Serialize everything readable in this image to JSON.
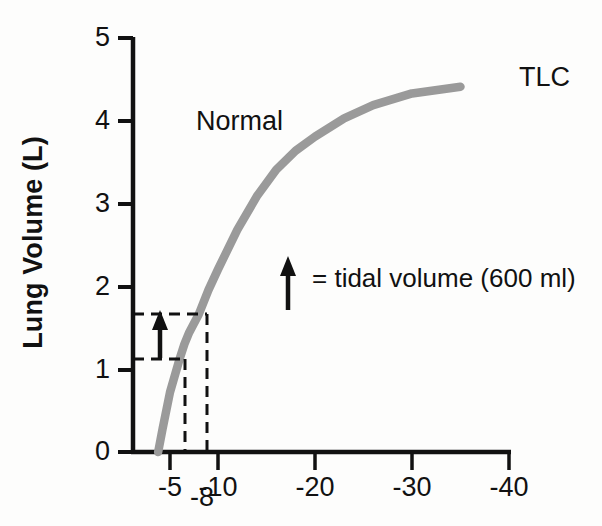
{
  "figure": {
    "background_color": "#fdfdfc",
    "curve_color": "#9a9a9a",
    "axis_color": "#111111"
  },
  "axes": {
    "y_title": "Lung Volume (L)",
    "y_ticks": [
      "5",
      "4",
      "3",
      "2",
      "1",
      "0"
    ],
    "x_ticks": [
      "-5",
      "-10",
      "-20",
      "-30",
      "-40"
    ],
    "x_extra_tick": "-8"
  },
  "annotations": {
    "curve_name": "Normal",
    "curve_end_label": "TLC",
    "legend_label": "= tidal volume (600 ml)",
    "legend_icon": "up-arrow-icon",
    "tidal_arrow_icon": "up-arrow-icon"
  },
  "chart_data": {
    "type": "line",
    "title": "",
    "subtitle": "",
    "xlabel": "",
    "ylabel": "Lung Volume (L)",
    "xlim": [
      0,
      -40
    ],
    "ylim": [
      0,
      5
    ],
    "x_tick_values": [
      -5,
      -10,
      -20,
      -30,
      -40
    ],
    "x_extra_tick_values": [
      -8
    ],
    "y_tick_values": [
      0,
      1,
      2,
      3,
      4,
      5
    ],
    "x_axis_scale": "nonlinear-compressed",
    "grid": false,
    "legend_position": "inside-center",
    "series": [
      {
        "name": "Normal",
        "color": "#9a9a9a",
        "style": "solid",
        "end_label": "TLC",
        "x": [
          -3.4,
          -4.0,
          -5.0,
          -6.0,
          -6.5,
          -7.0,
          -8.0,
          -9.0,
          -10.0,
          -12.0,
          -14.0,
          -16.0,
          -18.0,
          -20.0,
          -23.0,
          -26.0,
          -30.0,
          -35.0
        ],
        "y": [
          0.0,
          0.28,
          0.72,
          1.12,
          1.3,
          1.44,
          1.66,
          1.95,
          2.2,
          2.68,
          3.08,
          3.4,
          3.63,
          3.8,
          4.02,
          4.18,
          4.32,
          4.4
        ]
      }
    ],
    "annotations": [
      {
        "type": "guide-line",
        "style": "dashed",
        "orientation": "horizontal",
        "value": 1.66,
        "label": "end-inspiration volume"
      },
      {
        "type": "guide-line",
        "style": "dashed",
        "orientation": "horizontal",
        "value": 1.12,
        "label": "end-expiration volume (FRC)"
      },
      {
        "type": "guide-line",
        "style": "dashed",
        "orientation": "vertical",
        "value": -8,
        "label": "-8"
      },
      {
        "type": "guide-line",
        "style": "dashed",
        "orientation": "vertical",
        "value": -6.0,
        "label": ""
      },
      {
        "type": "arrow",
        "direction": "up",
        "from_y": 1.12,
        "to_y": 1.66,
        "label": "tidal volume (600 ml)"
      },
      {
        "type": "text",
        "text": "Normal",
        "x": -11.5,
        "y": 4.05
      },
      {
        "type": "text",
        "text": "TLC",
        "x": -37,
        "y": 4.4
      },
      {
        "type": "legend",
        "text": "= tidal volume (600 ml)",
        "x": -20,
        "y": 1.85
      }
    ]
  }
}
